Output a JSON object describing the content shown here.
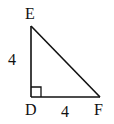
{
  "diagram": {
    "type": "right-triangle",
    "vertices": [
      {
        "id": "E",
        "label": "E",
        "x": 31,
        "y": 26
      },
      {
        "id": "D",
        "label": "D",
        "x": 31,
        "y": 97
      },
      {
        "id": "F",
        "label": "F",
        "x": 100,
        "y": 97
      }
    ],
    "right_angle_at": "D",
    "sides": [
      {
        "from": "E",
        "to": "D",
        "length_label": "4"
      },
      {
        "from": "D",
        "to": "F",
        "length_label": "4"
      },
      {
        "from": "E",
        "to": "F",
        "length_label": ""
      }
    ],
    "colors": {
      "stroke": "#111111",
      "background": "#ffffff"
    }
  }
}
